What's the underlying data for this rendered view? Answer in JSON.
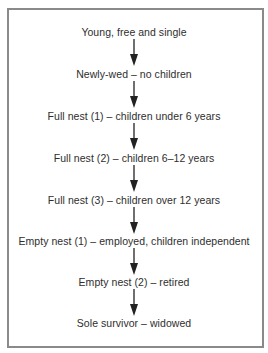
{
  "diagram": {
    "type": "flowchart",
    "direction": "top-to-bottom",
    "border_color": "#8a8a8a",
    "text_color": "#2e2e2e",
    "arrow_color": "#222222",
    "stages": [
      {
        "label": "Young, free and single"
      },
      {
        "label": "Newly-wed – no children"
      },
      {
        "label": "Full nest (1) – children under 6 years"
      },
      {
        "label": "Full nest (2) – children 6–12 years"
      },
      {
        "label": "Full nest (3) – children over 12 years"
      },
      {
        "label": "Empty nest (1) – employed, children independent"
      },
      {
        "label": "Empty nest (2) – retired"
      },
      {
        "label": "Sole survivor – widowed"
      }
    ],
    "connections": [
      {
        "from": 0,
        "to": 1,
        "icon": "arrow-down-icon"
      },
      {
        "from": 1,
        "to": 2,
        "icon": "arrow-down-icon"
      },
      {
        "from": 2,
        "to": 3,
        "icon": "arrow-down-icon"
      },
      {
        "from": 3,
        "to": 4,
        "icon": "arrow-down-icon"
      },
      {
        "from": 4,
        "to": 5,
        "icon": "arrow-down-icon"
      },
      {
        "from": 5,
        "to": 6,
        "icon": "arrow-down-icon"
      },
      {
        "from": 6,
        "to": 7,
        "icon": "arrow-down-icon"
      }
    ]
  }
}
